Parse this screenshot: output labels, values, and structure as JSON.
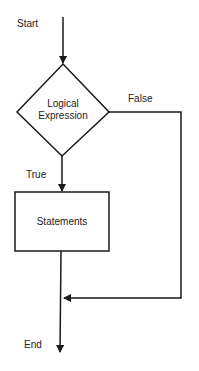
{
  "diagram": {
    "type": "flowchart",
    "start_label": "Start",
    "decision": {
      "line1": "Logical",
      "line2": "Expression"
    },
    "false_label": "False",
    "true_label": "True",
    "process_label": "Statements",
    "end_label": "End"
  },
  "colors": {
    "stroke": "#1a1a1a",
    "background": "#ffffff"
  }
}
